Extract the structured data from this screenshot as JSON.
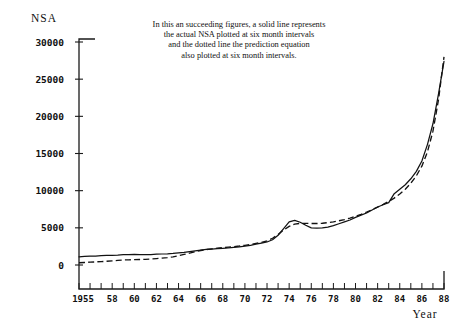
{
  "chart_data": {
    "type": "line",
    "title": "",
    "xlabel": "Year",
    "ylabel": "NSA",
    "xlim": [
      1955,
      1988
    ],
    "ylim": [
      -2000,
      30000
    ],
    "grid": false,
    "legend_position": "none",
    "annotations": [
      "In this an succeeding figures, a solid line represents",
      "the actual NSA plotted at six month intervals",
      "and the dotted line the prediction equation",
      "also plotted at six month intervals."
    ],
    "ytick_labels": [
      "0",
      "5000",
      "10000",
      "15000",
      "20000",
      "25000",
      "30000"
    ],
    "ytick_values": [
      0,
      5000,
      10000,
      15000,
      20000,
      25000,
      30000
    ],
    "xtick_labels": [
      "1955",
      "58",
      "60",
      "62",
      "64",
      "66",
      "68",
      "70",
      "72",
      "74",
      "76",
      "78",
      "80",
      "82",
      "84",
      "86",
      "88"
    ],
    "xtick_values": [
      1955,
      1958,
      1960,
      1962,
      1964,
      1966,
      1968,
      1970,
      1972,
      1974,
      1976,
      1978,
      1980,
      1982,
      1984,
      1986,
      1988
    ],
    "xtick_minor_step": 1,
    "series": [
      {
        "name": "actual NSA",
        "style": "solid",
        "color": "#121212",
        "x": [
          1955,
          1955.5,
          1956,
          1956.5,
          1957,
          1957.5,
          1958,
          1958.5,
          1959,
          1959.5,
          1960,
          1960.5,
          1961,
          1961.5,
          1962,
          1962.5,
          1963,
          1963.5,
          1964,
          1964.5,
          1965,
          1965.5,
          1966,
          1966.5,
          1967,
          1967.5,
          1968,
          1968.5,
          1969,
          1969.5,
          1970,
          1970.5,
          1971,
          1971.5,
          1972,
          1972.5,
          1973,
          1973.5,
          1974,
          1974.5,
          1975,
          1975.5,
          1976,
          1976.5,
          1977,
          1977.5,
          1978,
          1978.5,
          1979,
          1979.5,
          1980,
          1980.5,
          1981,
          1981.5,
          1982,
          1982.5,
          1983,
          1983.5,
          1984,
          1984.5,
          1985,
          1985.5,
          1986,
          1986.5,
          1987,
          1987.5,
          1988
        ],
        "y": [
          1100,
          1150,
          1180,
          1200,
          1250,
          1280,
          1300,
          1330,
          1380,
          1400,
          1420,
          1400,
          1380,
          1400,
          1450,
          1480,
          1500,
          1550,
          1620,
          1700,
          1800,
          1900,
          2000,
          2100,
          2150,
          2200,
          2250,
          2300,
          2380,
          2450,
          2550,
          2650,
          2800,
          2950,
          3100,
          3400,
          4000,
          4900,
          5800,
          6000,
          5750,
          5350,
          5000,
          4950,
          5000,
          5100,
          5300,
          5550,
          5800,
          6050,
          6400,
          6700,
          7000,
          7400,
          7800,
          8100,
          8400,
          9600,
          10200,
          10800,
          11600,
          12600,
          14000,
          16200,
          19000,
          23000,
          27400
        ]
      },
      {
        "name": "prediction equation",
        "style": "dashed",
        "color": "#121212",
        "x": [
          1955,
          1955.5,
          1956,
          1956.5,
          1957,
          1957.5,
          1958,
          1958.5,
          1959,
          1959.5,
          1960,
          1960.5,
          1961,
          1961.5,
          1962,
          1962.5,
          1963,
          1963.5,
          1964,
          1964.5,
          1965,
          1965.5,
          1966,
          1966.5,
          1967,
          1967.5,
          1968,
          1968.5,
          1969,
          1969.5,
          1970,
          1970.5,
          1971,
          1971.5,
          1972,
          1972.5,
          1973,
          1973.5,
          1974,
          1974.5,
          1975,
          1975.5,
          1976,
          1976.5,
          1977,
          1977.5,
          1978,
          1978.5,
          1979,
          1979.5,
          1980,
          1980.5,
          1981,
          1981.5,
          1982,
          1982.5,
          1983,
          1983.5,
          1984,
          1984.5,
          1985,
          1985.5,
          1986,
          1986.5,
          1987,
          1987.5,
          1988
        ],
        "y": [
          300,
          340,
          380,
          420,
          460,
          500,
          560,
          620,
          680,
          700,
          720,
          740,
          760,
          800,
          860,
          920,
          1000,
          1100,
          1250,
          1420,
          1600,
          1780,
          1950,
          2080,
          2180,
          2260,
          2330,
          2400,
          2470,
          2550,
          2650,
          2760,
          2900,
          3050,
          3250,
          3600,
          4100,
          4700,
          5200,
          5500,
          5600,
          5600,
          5580,
          5580,
          5620,
          5700,
          5800,
          5950,
          6100,
          6300,
          6550,
          6800,
          7100,
          7450,
          7800,
          8150,
          8550,
          9000,
          9550,
          10200,
          11000,
          12000,
          13300,
          15200,
          18000,
          22200,
          28000
        ]
      }
    ]
  },
  "axis": {
    "y_title": "NSA",
    "x_title": "Year"
  }
}
